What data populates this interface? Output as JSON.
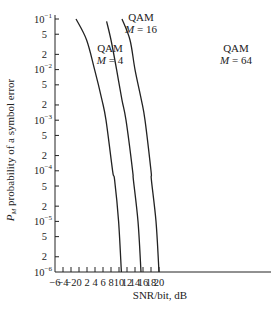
{
  "chart_data": {
    "type": "line",
    "title": "",
    "xlabel": "SNR/bit, dB",
    "ylabel": "P_M probability of a symbol error",
    "ylabel_parts": {
      "symbol": "P",
      "subscript": "M",
      "text": " probability of a symbol error"
    },
    "xlim": [
      -6,
      20
    ],
    "ylim": [
      1e-06,
      0.1
    ],
    "yscale": "log",
    "grid": false,
    "legend": "inline labels",
    "x_ticks": [
      -6,
      -4,
      -2,
      0,
      2,
      4,
      6,
      8,
      10,
      12,
      14,
      16,
      18,
      20
    ],
    "x_tick_labels": [
      "−6",
      "−4",
      "−2",
      "0",
      "2",
      "4",
      "6",
      "8",
      "10",
      "12",
      "14",
      "16",
      "18",
      "20"
    ],
    "y_ticks": [
      {
        "value": 0.1,
        "label": "10",
        "exp": "−1"
      },
      {
        "value": 0.05,
        "label": "5",
        "exp": ""
      },
      {
        "value": 0.02,
        "label": "2",
        "exp": ""
      },
      {
        "value": 0.01,
        "label": "10",
        "exp": "−2"
      },
      {
        "value": 0.005,
        "label": "5",
        "exp": ""
      },
      {
        "value": 0.002,
        "label": "2",
        "exp": ""
      },
      {
        "value": 0.001,
        "label": "10",
        "exp": "−3"
      },
      {
        "value": 0.0005,
        "label": "5",
        "exp": ""
      },
      {
        "value": 0.0002,
        "label": "2",
        "exp": ""
      },
      {
        "value": 0.0001,
        "label": "10",
        "exp": "−4"
      },
      {
        "value": 5e-05,
        "label": "5",
        "exp": ""
      },
      {
        "value": 2e-05,
        "label": "2",
        "exp": ""
      },
      {
        "value": 1e-05,
        "label": "10",
        "exp": "−5"
      },
      {
        "value": 5e-06,
        "label": "5",
        "exp": ""
      },
      {
        "value": 2e-06,
        "label": "2",
        "exp": ""
      },
      {
        "value": 1e-06,
        "label": "10",
        "exp": "−6"
      }
    ],
    "series": [
      {
        "name": "QAM M = 4",
        "label_line1": "QAM",
        "label_line2_var": "M",
        "label_line2_rest": " = 4",
        "label_pos": [
          110,
          52
        ],
        "x": [
          -0.75,
          1.9,
          3.9,
          5.75,
          6.75,
          8.4,
          8.9,
          9.9,
          10.6
        ],
        "y": [
          0.1,
          0.0385,
          0.01,
          0.0025,
          0.001,
          0.0001,
          6.6e-05,
          1e-05,
          1e-06
        ]
      },
      {
        "name": "QAM M = 16",
        "label_line1": "QAM",
        "label_line2_var": "M",
        "label_line2_rest": " = 16",
        "label_pos": [
          141,
          21
        ],
        "x": [
          6.9,
          8.0,
          9.4,
          10.75,
          11.75,
          13.4,
          13.6,
          14.75,
          15.5
        ],
        "y": [
          0.09,
          0.0385,
          0.01,
          0.0025,
          0.001,
          0.0001,
          6.6e-05,
          1e-05,
          1e-06
        ]
      },
      {
        "name": "QAM M = 64",
        "label_line1": "QAM",
        "label_line2_var": "M",
        "label_line2_rest": " = 64",
        "label_pos": [
          236,
          52
        ],
        "x": [
          10.75,
          12.75,
          14.0,
          15.6,
          16.5,
          18.0,
          18.1,
          19.25,
          20.0
        ],
        "y": [
          0.1,
          0.0385,
          0.01,
          0.0025,
          0.001,
          0.0001,
          6.6e-05,
          1e-05,
          1e-06
        ]
      }
    ],
    "layout": {
      "plot_left": 55,
      "plot_right": 271,
      "plot_top": 19,
      "plot_bottom": 272,
      "x_px_per_unit": 4,
      "decade_px": 50.6,
      "xlabel_pos": [
        160,
        299
      ],
      "ylabel_pos": [
        10,
        150
      ]
    }
  }
}
